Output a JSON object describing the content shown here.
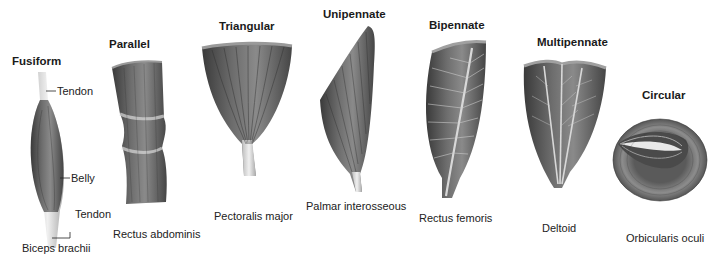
{
  "figure": {
    "type": "muscle-shape-classification",
    "colors": {
      "muscle_dark": "#3c3c3c",
      "muscle_mid": "#7a7a7a",
      "muscle_light": "#c8c8c8",
      "tendon": "#e4e4e4",
      "background": "#ffffff",
      "text": "#1a1a1a"
    },
    "muscles": [
      {
        "shape": "Fusiform",
        "example": "Biceps brachii",
        "labels": {
          "tendon_top": "Tendon",
          "belly": "Belly",
          "tendon_bottom": "Tendon"
        }
      },
      {
        "shape": "Parallel",
        "example": "Rectus abdominis"
      },
      {
        "shape": "Triangular",
        "example": "Pectoralis major"
      },
      {
        "shape": "Unipennate",
        "example": "Palmar interosseous"
      },
      {
        "shape": "Bipennate",
        "example": "Rectus femoris"
      },
      {
        "shape": "Multipennate",
        "example": "Deltoid"
      },
      {
        "shape": "Circular",
        "example": "Orbicularis oculi"
      }
    ]
  }
}
